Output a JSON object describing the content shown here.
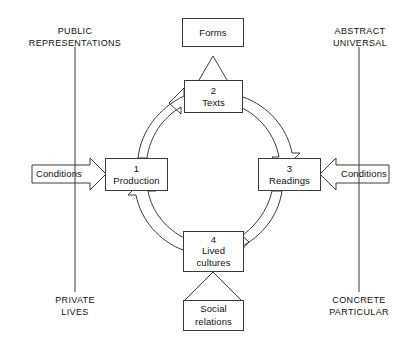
{
  "diagram": {
    "nodes": [
      {
        "id": "forms",
        "number": "",
        "label": "Forms",
        "label2": ""
      },
      {
        "id": "texts",
        "number": "2",
        "label": "Texts",
        "label2": ""
      },
      {
        "id": "production",
        "number": "1",
        "label": "Production",
        "label2": ""
      },
      {
        "id": "readings",
        "number": "3",
        "label": "Readings",
        "label2": ""
      },
      {
        "id": "lived-cultures",
        "number": "4",
        "label": "Lived",
        "label2": "cultures"
      },
      {
        "id": "social-relations",
        "number": "",
        "label": "Social",
        "label2": "relations"
      }
    ],
    "axis_labels": [
      {
        "id": "top-left",
        "text": "PUBLIC\nREPRESENTATIONS"
      },
      {
        "id": "top-right",
        "text": "ABSTRACT\nUNIVERSAL"
      },
      {
        "id": "bottom-left",
        "text": "PRIVATE\nLIVES"
      },
      {
        "id": "bottom-right",
        "text": "CONCRETE\nPARTICULAR"
      }
    ],
    "conditions": [
      {
        "id": "left",
        "text": "Conditions",
        "direction": "right"
      },
      {
        "id": "right",
        "text": "Conditions",
        "direction": "left"
      }
    ],
    "colors": {
      "stroke": "#3a3a3a",
      "text": "#111111",
      "background": "#ffffff"
    }
  }
}
